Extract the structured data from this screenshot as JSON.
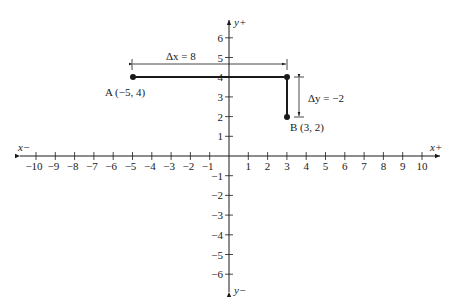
{
  "diagram": {
    "type": "coordinate-plane",
    "axes": {
      "x_neg_label": "x−",
      "x_pos_label": "x+",
      "y_pos_label": "y+",
      "y_neg_label": "y−",
      "x_ticks": [
        "−10",
        "−9",
        "−8",
        "−7",
        "−6",
        "−5",
        "−4",
        "−3",
        "−2",
        "−1",
        "1",
        "2",
        "3",
        "4",
        "5",
        "6",
        "7",
        "8",
        "9",
        "10"
      ],
      "y_ticks_pos": [
        "1",
        "2",
        "3",
        "4",
        "5",
        "6"
      ],
      "y_ticks_neg": [
        "−1",
        "−2",
        "−3",
        "−4",
        "−5",
        "−6"
      ]
    },
    "points": [
      {
        "name": "A",
        "label": "A (−5, 4)",
        "x": -5,
        "y": 4
      },
      {
        "name": "B",
        "label": "B (3, 2)",
        "x": 3,
        "y": 2
      }
    ],
    "delta_x": {
      "label": "Δx = 8"
    },
    "delta_y": {
      "label": "Δy = −2"
    },
    "colors": {
      "ink": "#1a1a1a",
      "background": "#ffffff"
    }
  }
}
